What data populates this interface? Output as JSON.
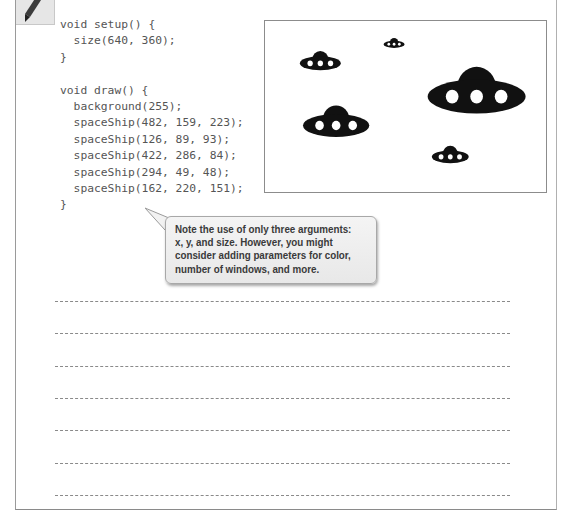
{
  "icons": {
    "pencil": "pencil-icon"
  },
  "code": {
    "language": "Processing",
    "lines": [
      "void setup() {",
      "  size(640, 360);",
      "}",
      "",
      "void draw() {",
      "  background(255);",
      "  spaceShip(482, 159, 223);",
      "  spaceShip(126, 89, 93);",
      "  spaceShip(422, 286, 84);",
      "  spaceShip(294, 49, 48);",
      "  spaceShip(162, 220, 151);",
      "}"
    ]
  },
  "sketch_output": {
    "canvas_size": [
      640,
      360
    ],
    "background": "#ffffff",
    "ship_color": "#111111",
    "window_color": "#ffffff",
    "ships": [
      {
        "x": 482,
        "y": 159,
        "size": 223
      },
      {
        "x": 126,
        "y": 89,
        "size": 93
      },
      {
        "x": 422,
        "y": 286,
        "size": 84
      },
      {
        "x": 294,
        "y": 49,
        "size": 48
      },
      {
        "x": 162,
        "y": 220,
        "size": 151
      }
    ]
  },
  "callout": {
    "text": "Note the use of only three arguments: x, y, and size. However, you might consider adding parameters for color, number of windows, and more.",
    "lines": [
      "Note the use of only three arguments:",
      "x, y, and size. However, you might",
      "consider adding parameters for color,",
      "number of windows, and more."
    ]
  },
  "notes": {
    "line_count": 7
  }
}
